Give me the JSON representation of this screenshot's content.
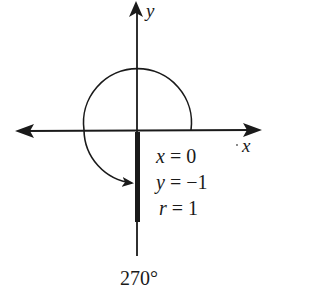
{
  "diagram": {
    "axes": {
      "x_label": "x",
      "y_label": "y"
    },
    "angle_label": "270°",
    "values": [
      {
        "var": "x",
        "eq": " = 0"
      },
      {
        "var": "y",
        "eq": " = −1"
      },
      {
        "var": "r",
        "eq": " = 1"
      }
    ],
    "colors": {
      "ink": "#1a1a1a",
      "background": "#ffffff"
    }
  }
}
